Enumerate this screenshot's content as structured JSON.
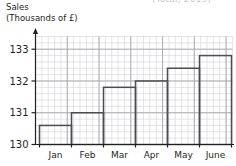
{
  "header": {
    "cropped_text": "(Total, 2019)"
  },
  "axis_title": {
    "line1": "Sales",
    "line2": "(Thousands of £)"
  },
  "chart_data": {
    "type": "bar",
    "title": "Sales (Thousands of £)",
    "xlabel": "",
    "ylabel": "Sales (Thousands of £)",
    "categories": [
      "Jan",
      "Feb",
      "Mar",
      "Apr",
      "May",
      "June"
    ],
    "values": [
      130.6,
      131.0,
      131.8,
      132.0,
      132.4,
      132.8
    ],
    "ylim": [
      130,
      133.4
    ],
    "ytick_labels": [
      "130",
      "131",
      "132",
      "133"
    ],
    "ytick_values": [
      130,
      131,
      132,
      133
    ],
    "yminor_step": 0.2,
    "grid": true,
    "legend": null,
    "bar_fill": "#ffffff",
    "bar_stroke": "#4d4d4f",
    "grid_minor_color": "#d8d8dc",
    "grid_major_color": "#a7a7ad",
    "axis_color": "#231f20"
  }
}
